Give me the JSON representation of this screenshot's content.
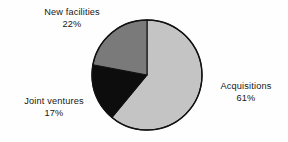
{
  "chart_data": {
    "type": "pie",
    "title": "",
    "subtitle": "",
    "xlabel": "",
    "ylabel": "",
    "grid": false,
    "legend": "none",
    "label_position": "outside",
    "start_angle_deg": 0,
    "direction": "clockwise",
    "categories": [
      "Acquisitions",
      "Joint ventures",
      "New facilities"
    ],
    "values": [
      61,
      17,
      22
    ],
    "unit": "%",
    "slices": [
      {
        "label": "Acquisitions",
        "value": 61,
        "value_text": "61%",
        "color": "#c4c4c4",
        "start_deg": 0,
        "end_deg": 219.6
      },
      {
        "label": "Joint ventures",
        "value": 17,
        "value_text": "17%",
        "color": "#0d0d0d",
        "start_deg": 219.6,
        "end_deg": 280.8
      },
      {
        "label": "New facilities",
        "value": 22,
        "value_text": "22%",
        "color": "#7a7a7a",
        "start_deg": 280.8,
        "end_deg": 360
      }
    ]
  },
  "labels": {
    "new_facilities": {
      "name": "New facilities",
      "percent": "22%"
    },
    "joint_ventures": {
      "name": "Joint ventures",
      "percent": "17%"
    },
    "acquisitions": {
      "name": "Acquisitions",
      "percent": "61%"
    }
  },
  "geometry": {
    "center_x": 147,
    "center_y": 75,
    "radius": 55
  },
  "colors": {
    "background": "#fefefe",
    "outline": "#111111",
    "text": "#161616",
    "slice_acquisitions": "#c4c4c4",
    "slice_joint_ventures": "#0d0d0d",
    "slice_new_facilities": "#7a7a7a"
  }
}
